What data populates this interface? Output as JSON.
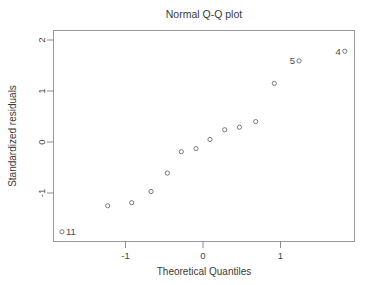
{
  "figure": {
    "title": "Normal Q-Q plot",
    "xlabel": "Theoretical Quantiles",
    "ylabel": "Standardized residuals"
  },
  "chart_data": {
    "type": "scatter",
    "title": "Normal Q-Q plot",
    "xlabel": "Theoretical Quantiles",
    "ylabel": "Standardized residuals",
    "xlim": [
      -2.01,
      1.9
    ],
    "ylim": [
      -2.02,
      2.17
    ],
    "xticks": [
      -1,
      0,
      1
    ],
    "xtick_labels": [
      "-1",
      "0",
      "1"
    ],
    "yticks": [
      2,
      1,
      0,
      -1
    ],
    "ytick_labels": [
      "2",
      "1",
      "0",
      "-1"
    ],
    "grid": false,
    "legend": "none",
    "marker": "open-circle",
    "marker_color": "#6b6b6b",
    "frame_color": "#999999",
    "points": [
      {
        "x": -1.82,
        "y": -1.76,
        "label": "11",
        "label_side": "right"
      },
      {
        "x": -1.23,
        "y": -1.25,
        "label": "",
        "label_side": ""
      },
      {
        "x": -0.92,
        "y": -1.19,
        "label": "",
        "label_side": ""
      },
      {
        "x": -0.67,
        "y": -0.97,
        "label": "",
        "label_side": ""
      },
      {
        "x": -0.46,
        "y": -0.61,
        "label": "",
        "label_side": ""
      },
      {
        "x": -0.28,
        "y": -0.19,
        "label": "",
        "label_side": ""
      },
      {
        "x": -0.09,
        "y": -0.13,
        "label": "",
        "label_side": ""
      },
      {
        "x": 0.09,
        "y": 0.05,
        "label": "",
        "label_side": ""
      },
      {
        "x": 0.28,
        "y": 0.24,
        "label": "",
        "label_side": ""
      },
      {
        "x": 0.47,
        "y": 0.29,
        "label": "",
        "label_side": ""
      },
      {
        "x": 0.68,
        "y": 0.4,
        "label": "",
        "label_side": ""
      },
      {
        "x": 0.92,
        "y": 1.15,
        "label": "",
        "label_side": ""
      },
      {
        "x": 1.24,
        "y": 1.59,
        "label": "5",
        "label_side": "left"
      },
      {
        "x": 1.83,
        "y": 1.78,
        "label": "4",
        "label_side": "left"
      }
    ]
  },
  "axes_geometry": {
    "plot_left": 53,
    "plot_right": 355,
    "plot_top": 30,
    "plot_bottom": 242,
    "x_zero_px": 203,
    "x_unit_px": 77.5,
    "y_zero_px": 142,
    "y_unit_px": 51.0
  }
}
